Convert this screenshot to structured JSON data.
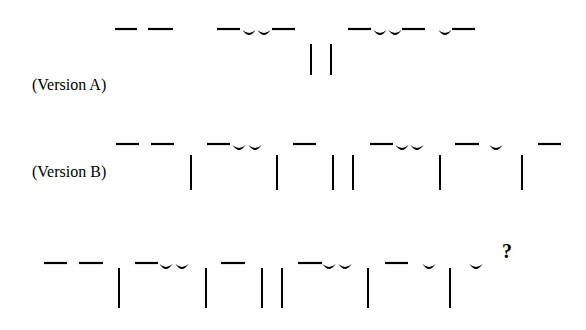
{
  "figure": {
    "type": "metrical-scansion-diagram",
    "rows": [
      {
        "id": "version-a",
        "label": "(Version A)",
        "label_pos": {
          "x": 32,
          "y": 85
        },
        "mark_y": 29,
        "bar_top": 44,
        "bar_bottom": 75,
        "marks": [
          {
            "t": "long",
            "x1": 115,
            "x2": 137
          },
          {
            "t": "long",
            "x1": 148,
            "x2": 173
          },
          {
            "t": "long",
            "x1": 217,
            "x2": 240
          },
          {
            "t": "short",
            "cx": 249
          },
          {
            "t": "short",
            "cx": 264
          },
          {
            "t": "long",
            "x1": 272,
            "x2": 295
          },
          {
            "t": "bar",
            "x": 311
          },
          {
            "t": "bar",
            "x": 331
          },
          {
            "t": "long",
            "x1": 348,
            "x2": 371
          },
          {
            "t": "short",
            "cx": 380
          },
          {
            "t": "short",
            "cx": 395
          },
          {
            "t": "long",
            "x1": 402,
            "x2": 425
          },
          {
            "t": "short",
            "cx": 445
          },
          {
            "t": "long",
            "x1": 452,
            "x2": 475
          }
        ]
      },
      {
        "id": "version-b",
        "label": "(Version B)",
        "label_pos": {
          "x": 32,
          "y": 172
        },
        "mark_y": 144,
        "bar_top": 155,
        "bar_bottom": 190,
        "marks": [
          {
            "t": "long",
            "x1": 116,
            "x2": 139
          },
          {
            "t": "long",
            "x1": 151,
            "x2": 174
          },
          {
            "t": "bar",
            "x": 191
          },
          {
            "t": "long",
            "x1": 207,
            "x2": 230
          },
          {
            "t": "short",
            "cx": 239
          },
          {
            "t": "short",
            "cx": 255
          },
          {
            "t": "bar",
            "x": 277
          },
          {
            "t": "long",
            "x1": 293,
            "x2": 316
          },
          {
            "t": "bar",
            "x": 333
          },
          {
            "t": "bar",
            "x": 353
          },
          {
            "t": "long",
            "x1": 370,
            "x2": 393
          },
          {
            "t": "short",
            "cx": 402
          },
          {
            "t": "short",
            "cx": 417
          },
          {
            "t": "bar",
            "x": 440
          },
          {
            "t": "long",
            "x1": 455,
            "x2": 479
          },
          {
            "t": "short",
            "cx": 496
          },
          {
            "t": "bar",
            "x": 522
          },
          {
            "t": "long",
            "x1": 538,
            "x2": 561
          }
        ]
      },
      {
        "id": "version-c",
        "label": "",
        "label_pos": {
          "x": 0,
          "y": 0
        },
        "mark_y": 263,
        "bar_top": 268,
        "bar_bottom": 308,
        "marks": [
          {
            "t": "long",
            "x1": 44,
            "x2": 67
          },
          {
            "t": "long",
            "x1": 79,
            "x2": 103
          },
          {
            "t": "bar",
            "x": 119
          },
          {
            "t": "long",
            "x1": 135,
            "x2": 158
          },
          {
            "t": "short",
            "cx": 166
          },
          {
            "t": "short",
            "cx": 182
          },
          {
            "t": "bar",
            "x": 206
          },
          {
            "t": "long",
            "x1": 221,
            "x2": 245
          },
          {
            "t": "bar",
            "x": 262
          },
          {
            "t": "bar",
            "x": 282
          },
          {
            "t": "long",
            "x1": 298,
            "x2": 322
          },
          {
            "t": "short",
            "cx": 329
          },
          {
            "t": "short",
            "cx": 345
          },
          {
            "t": "bar",
            "x": 368
          },
          {
            "t": "long",
            "x1": 385,
            "x2": 408
          },
          {
            "t": "short",
            "cx": 429
          },
          {
            "t": "bar",
            "x": 450
          },
          {
            "t": "short",
            "cx": 476
          }
        ],
        "trailing_symbol": "?",
        "trailing_pos": {
          "x": 502,
          "y": 240
        }
      }
    ],
    "legend": {
      "long": "long syllable (macron)",
      "short": "short syllable (breve)",
      "bar": "foot/line divider"
    },
    "colors": {
      "ink": "#000000",
      "background": "#ffffff"
    }
  }
}
